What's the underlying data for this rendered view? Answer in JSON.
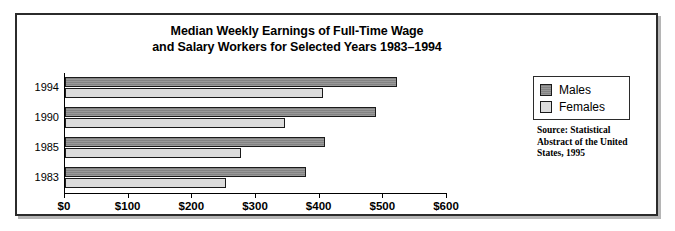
{
  "chart_data": {
    "type": "bar",
    "orientation": "horizontal",
    "title": "Median Weekly Earnings of Full-Time Wage and Salary Workers for Selected Years 1983–1994",
    "title_lines": [
      "Median Weekly Earnings of Full-Time Wage",
      "and Salary Workers for Selected Years 1983–1994"
    ],
    "categories": [
      "1994",
      "1990",
      "1985",
      "1983"
    ],
    "series": [
      {
        "name": "Males",
        "values": [
          522,
          489,
          408,
          379
        ],
        "color": "#8a8a8a"
      },
      {
        "name": "Females",
        "values": [
          405,
          346,
          277,
          253
        ],
        "color": "#dcdcdc"
      }
    ],
    "xlabel": "",
    "ylabel": "",
    "xlim": [
      0,
      600
    ],
    "xticks": [
      0,
      100,
      200,
      300,
      400,
      500,
      600
    ],
    "xtick_labels": [
      "$0",
      "$100",
      "$200",
      "$300",
      "$400",
      "$500",
      "$600"
    ],
    "grid": false,
    "legend_position": "right",
    "source": "Source: Statistical Abstract of the United States, 1995",
    "source_lines": [
      "Source: Statistical",
      "Abstract of the United",
      "States, 1995"
    ]
  },
  "legend": {
    "entries": [
      {
        "label": "Males"
      },
      {
        "label": "Females"
      }
    ]
  }
}
